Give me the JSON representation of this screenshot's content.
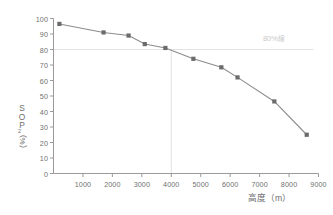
{
  "chart_data": {
    "type": "line",
    "title": "",
    "xlabel": "高度（m）",
    "ylabel": "SOP₂（%）",
    "ylabel_chars": [
      "S",
      "O",
      "P"
    ],
    "ylabel_subscript": "2",
    "ylabel_unit": "（%）",
    "xlim": [
      0,
      9000
    ],
    "ylim": [
      0,
      100
    ],
    "grid": false,
    "legend": null,
    "x": [
      200,
      1700,
      2550,
      3100,
      3800,
      4750,
      5700,
      6250,
      7500,
      8600
    ],
    "values": [
      96.5,
      91.0,
      89.0,
      83.5,
      81.0,
      74.0,
      68.5,
      62.0,
      46.5,
      25.0
    ],
    "x_ticks": [
      1000,
      2000,
      3000,
      4000,
      5000,
      6000,
      7000,
      8000,
      9000
    ],
    "x_tick_labels": [
      "1000",
      "2000",
      "3000",
      "4000",
      "5000",
      "6000",
      "7000",
      "8000",
      "9000"
    ],
    "y_ticks": [
      0,
      10,
      20,
      30,
      40,
      50,
      60,
      70,
      80,
      90,
      100
    ],
    "y_tick_labels": [
      "0",
      "10",
      "20",
      "30",
      "40",
      "50",
      "60",
      "70",
      "80",
      "90",
      "100"
    ],
    "annotations": [
      {
        "name": "threshold-line-label",
        "text": "80%",
        "suffix": "線",
        "y_value": 80
      }
    ],
    "reference_lines": [
      {
        "name": "threshold-80-horizontal",
        "orientation": "horizontal",
        "value": 80
      },
      {
        "name": "threshold-4000-vertical",
        "orientation": "vertical",
        "value": 4000
      }
    ],
    "series_color": "#8c8c8c",
    "marker_color": "#6b6b6b",
    "axis_color": "#9a9a9a",
    "reference_line_color": "#e2e2e2",
    "annotation_color": "#c8c8c8"
  }
}
